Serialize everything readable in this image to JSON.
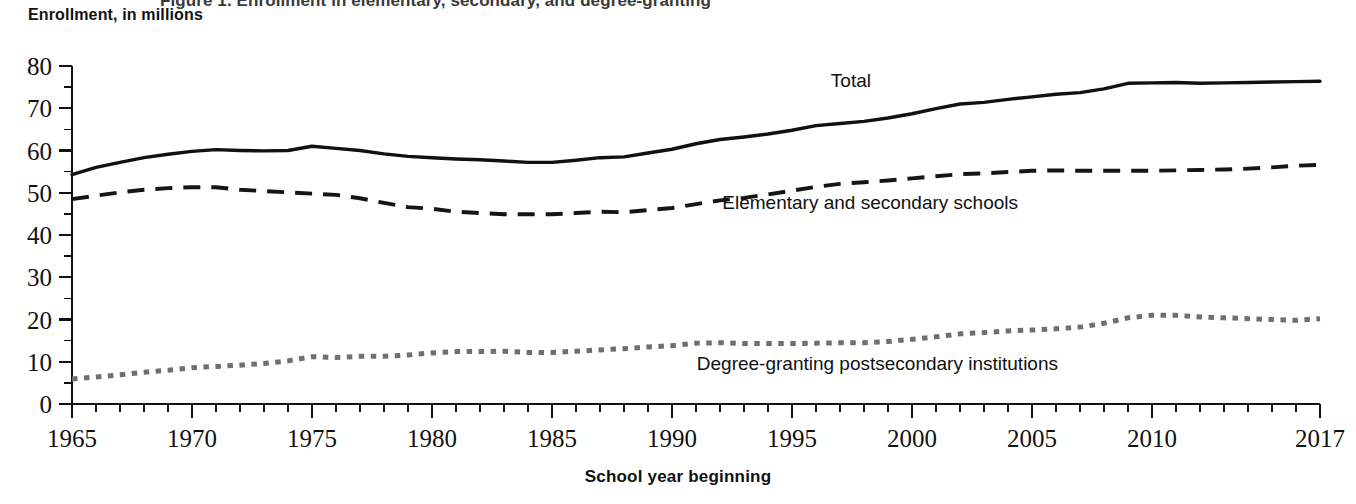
{
  "figure": {
    "cut_off_title": "Figure 1. Enrollment in elementary, secondary, and degree-granting",
    "y_axis_title": "Enrollment, in millions",
    "x_axis_title": "School year beginning"
  },
  "chart_data": {
    "type": "line",
    "title": "Enrollment, in millions",
    "xlabel": "School year beginning",
    "ylabel": "Enrollment, in millions",
    "xlim": [
      1965,
      2017
    ],
    "ylim": [
      0,
      80
    ],
    "grid": false,
    "legend_position": "inline-annotations",
    "y_ticks": [
      0,
      10,
      20,
      30,
      40,
      50,
      60,
      70,
      80
    ],
    "y_tick_labels": [
      "0",
      "10",
      "20",
      "30",
      "40",
      "50",
      "60",
      "70",
      "80"
    ],
    "y_minor_tick_interval": 5,
    "x_ticks": [
      1965,
      1970,
      1975,
      1980,
      1985,
      1990,
      1995,
      2000,
      2005,
      2010,
      2017
    ],
    "x_tick_labels": [
      "1965",
      "1970",
      "1975",
      "1980",
      "1985",
      "1990",
      "1995",
      "2000",
      "2005",
      "2010",
      "2017"
    ],
    "x_minor_tick_interval": 1,
    "x": [
      1965,
      1966,
      1967,
      1968,
      1969,
      1970,
      1971,
      1972,
      1973,
      1974,
      1975,
      1976,
      1977,
      1978,
      1979,
      1980,
      1981,
      1982,
      1983,
      1984,
      1985,
      1986,
      1987,
      1988,
      1989,
      1990,
      1991,
      1992,
      1993,
      1994,
      1995,
      1996,
      1997,
      1998,
      1999,
      2000,
      2001,
      2002,
      2003,
      2004,
      2005,
      2006,
      2007,
      2008,
      2009,
      2010,
      2011,
      2012,
      2013,
      2014,
      2015,
      2016,
      2017
    ],
    "series": [
      {
        "name": "Total",
        "style": "solid",
        "color": "#111111",
        "label_text": "Total",
        "values": [
          54.3,
          56.0,
          57.2,
          58.3,
          59.1,
          59.8,
          60.2,
          60.0,
          59.9,
          60.0,
          61.0,
          60.5,
          60.0,
          59.2,
          58.6,
          58.3,
          58.0,
          57.8,
          57.5,
          57.2,
          57.2,
          57.7,
          58.3,
          58.5,
          59.4,
          60.3,
          61.6,
          62.6,
          63.2,
          63.9,
          64.8,
          65.9,
          66.4,
          66.9,
          67.7,
          68.7,
          69.9,
          71.0,
          71.4,
          72.1,
          72.7,
          73.3,
          73.7,
          74.6,
          75.9,
          76.0,
          76.1,
          75.9,
          76.0,
          76.1,
          76.2,
          76.3,
          76.4
        ]
      },
      {
        "name": "Elementary and secondary schools",
        "style": "dashed",
        "color": "#151515",
        "label_text": "Elementary and secondary schools",
        "values": [
          48.5,
          49.3,
          50.1,
          50.7,
          51.1,
          51.3,
          51.3,
          50.7,
          50.4,
          50.1,
          49.8,
          49.5,
          48.7,
          47.6,
          46.6,
          46.2,
          45.5,
          45.2,
          44.9,
          44.9,
          44.9,
          45.2,
          45.5,
          45.4,
          45.9,
          46.4,
          47.3,
          48.2,
          48.8,
          49.6,
          50.5,
          51.4,
          52.1,
          52.5,
          52.9,
          53.4,
          53.9,
          54.4,
          54.6,
          54.9,
          55.2,
          55.3,
          55.2,
          55.2,
          55.2,
          55.2,
          55.3,
          55.4,
          55.5,
          55.7,
          56.0,
          56.4,
          56.6
        ]
      },
      {
        "name": "Degree-granting postsecondary institutions",
        "style": "dotted",
        "color": "#6f6f6f",
        "label_text": "Degree-granting postsecondary institutions",
        "values": [
          5.9,
          6.4,
          6.9,
          7.5,
          8.0,
          8.6,
          8.9,
          9.2,
          9.6,
          10.2,
          11.2,
          11.0,
          11.3,
          11.3,
          11.6,
          12.1,
          12.4,
          12.4,
          12.5,
          12.2,
          12.2,
          12.5,
          12.8,
          13.1,
          13.5,
          13.8,
          14.4,
          14.5,
          14.3,
          14.3,
          14.3,
          14.4,
          14.5,
          14.5,
          14.8,
          15.3,
          15.9,
          16.6,
          16.9,
          17.3,
          17.5,
          17.8,
          18.2,
          19.1,
          20.4,
          21.0,
          21.0,
          20.6,
          20.4,
          20.2,
          20.0,
          19.8,
          20.2
        ]
      }
    ],
    "annotations": [
      {
        "text": "Total",
        "x_px": 871,
        "y_px": 87
      },
      {
        "text": "Elementary and secondary schools",
        "x_px": 1018,
        "y_px": 209
      },
      {
        "text": "Degree-granting postsecondary institutions",
        "x_px": 1058,
        "y_px": 370
      }
    ]
  }
}
